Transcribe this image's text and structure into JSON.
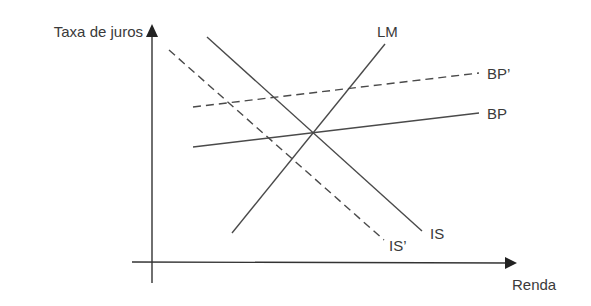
{
  "diagram": {
    "type": "IS-LM-BP model",
    "axes": {
      "y_label": "Taxa de juros",
      "x_label": "Renda"
    },
    "curves": [
      {
        "id": "LM",
        "label": "LM",
        "style": "solid",
        "from": [
          232,
          233
        ],
        "to": [
          385,
          44
        ]
      },
      {
        "id": "IS",
        "label": "IS",
        "style": "solid",
        "from": [
          207,
          37
        ],
        "to": [
          422,
          231
        ]
      },
      {
        "id": "IS_prime",
        "label": "IS’",
        "style": "dashed",
        "from": [
          169,
          50
        ],
        "to": [
          384,
          240
        ]
      },
      {
        "id": "BP",
        "label": "BP",
        "style": "solid",
        "from": [
          193,
          147
        ],
        "to": [
          479,
          113
        ]
      },
      {
        "id": "BP_prime",
        "label": "BP’",
        "style": "dashed",
        "from": [
          193,
          107
        ],
        "to": [
          479,
          73
        ]
      }
    ],
    "colors": {
      "line": "#4a4a4a",
      "text": "#3a3a3a",
      "background": "#ffffff"
    }
  }
}
